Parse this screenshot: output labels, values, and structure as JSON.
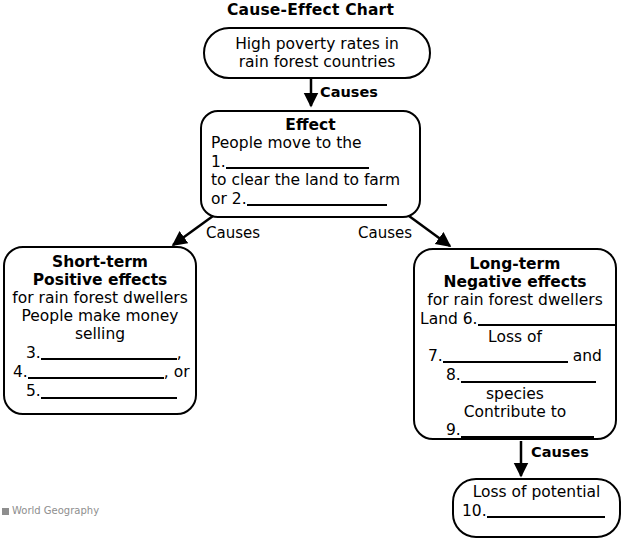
{
  "chart_title": "Cause-Effect Chart",
  "nodes": {
    "poverty": {
      "line1": "High poverty rates in",
      "line2": "rain forest countries"
    },
    "effect": {
      "heading": "Effect",
      "line1": "People move to the",
      "blank1_number": "1.",
      "line2": "to clear the land to farm",
      "line3_prefix": "or",
      "blank2_number": "2."
    },
    "short_term": {
      "heading_line1": "Short-term",
      "heading_line2": "Positive effects",
      "line1": "for rain forest dwellers",
      "line2": "People make money",
      "line3": "selling",
      "blank3_number": "3.",
      "blank3_suffix": ",",
      "blank4_number": "4.",
      "blank4_suffix": ", or",
      "blank5_number": "5."
    },
    "long_term": {
      "heading_line1": "Long-term",
      "heading_line2": "Negative effects",
      "line1": "for rain forest dwellers",
      "line2_prefix": "Land",
      "blank6_number": "6.",
      "line3": "Loss of",
      "blank7_number": "7.",
      "blank7_suffix": "and",
      "blank8_number": "8.",
      "line4": "species",
      "line5": "Contribute to",
      "blank9_number": "9."
    },
    "loss_potential": {
      "line1": "Loss of potential",
      "blank10_number": "10."
    }
  },
  "edges": {
    "causes_top": "Causes",
    "causes_left": "Causes",
    "causes_right": "Causes",
    "causes_bottom": "Causes"
  },
  "footer": {
    "note": "World Geography"
  },
  "colors": {
    "stroke": "#000000",
    "background": "#ffffff",
    "footer_text": "#8e8e8e"
  }
}
